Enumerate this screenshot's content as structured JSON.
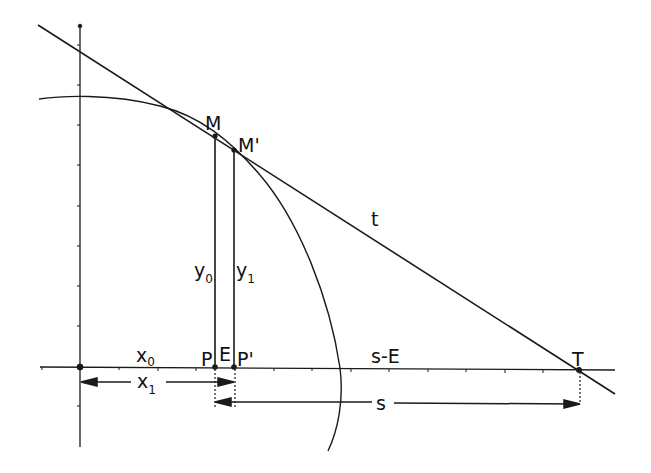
{
  "diagram": {
    "title": "",
    "colors": {
      "stroke": "#1a1a1a",
      "background": "#ffffff"
    },
    "labels": {
      "M": "M",
      "M_prime": "M'",
      "t": "t",
      "y0_main": "y",
      "y0_sub": "0",
      "y1_main": "y",
      "y1_sub": "1",
      "x0_main": "x",
      "x0_sub": "0",
      "x1_main": "x",
      "x1_sub": "1",
      "P": "P",
      "E": "E",
      "P_prime": "P'",
      "s_minus_E": "s-E",
      "T": "T",
      "s": "s"
    },
    "points": {
      "origin": [
        80,
        367
      ],
      "M": [
        215,
        136
      ],
      "M_prime": [
        234,
        150
      ],
      "P": [
        215,
        367
      ],
      "P_prime": [
        234,
        367
      ],
      "T": [
        579,
        370
      ]
    },
    "elements": [
      "x-axis with tick marks",
      "y-axis with tick marks",
      "curve (arc of ellipse)",
      "tangent line t through M and M'",
      "ordinate y0 from P to M",
      "ordinate y1 from P' to M'",
      "dimension x1 from origin to P'",
      "dimension s from P to T"
    ]
  }
}
